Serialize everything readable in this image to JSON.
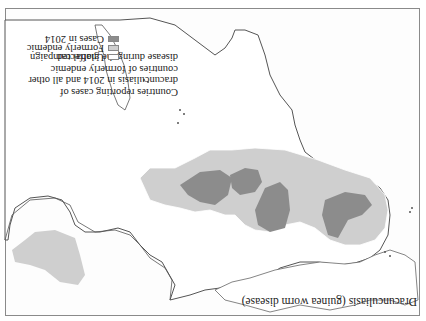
{
  "figure": {
    "title": "Dracunculiasis (guinea worm disease)",
    "orientation": "rotated 180 degrees",
    "description": "Countries reporting cases of dracunculiasis in 2014 and all other countries of formerly endemic disease during the global campaign"
  },
  "legend": {
    "items": [
      {
        "label": "Unaffected",
        "color": "#ffffff"
      },
      {
        "label": "Formerly endemic",
        "color": "#cfcfcf"
      },
      {
        "label": "Cases in 2014",
        "color": "#8c8c8c"
      }
    ]
  },
  "colors": {
    "unaffected": "#ffffff",
    "formerly_endemic": "#cfcfcf",
    "cases_2014": "#8c8c8c",
    "coastline": "#555555",
    "background": "#fdfdfd"
  }
}
